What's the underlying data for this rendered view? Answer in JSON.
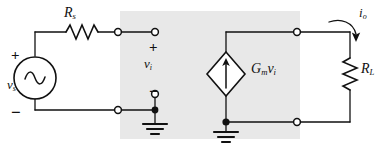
{
  "figure": {
    "kind": "circuit-schematic",
    "background_color": "#ffffff",
    "wire_color": "#111111",
    "shaded_region_color": "#e8e8e8"
  },
  "labels": {
    "source_resistor": "R",
    "source_resistor_sub": "s",
    "source_voltage": "v",
    "source_voltage_sub": "s",
    "input_voltage": "v",
    "input_voltage_sub": "i",
    "dependent_source_gm": "G",
    "dependent_source_gm_sub": "m",
    "dependent_source_v": "v",
    "dependent_source_v_sub": "i",
    "load_resistor": "R",
    "load_resistor_sub": "L",
    "output_current": "i",
    "output_current_sub": "o"
  },
  "polarity": {
    "source_plus": "+",
    "source_minus": "−",
    "input_plus": "+",
    "input_minus": "−"
  },
  "components": [
    {
      "name": "source-resistor-rs",
      "type": "resistor",
      "orientation": "horizontal",
      "label": "R_s"
    },
    {
      "name": "voltage-source-vs",
      "type": "ac-voltage-source",
      "orientation": "vertical",
      "label": "v_s"
    },
    {
      "name": "dependent-current-source",
      "type": "dependent-current-source",
      "orientation": "vertical",
      "label": "G_m v_i"
    },
    {
      "name": "load-resistor-rl",
      "type": "resistor",
      "orientation": "vertical",
      "label": "R_L"
    },
    {
      "name": "ground-input",
      "type": "ground",
      "orientation": "vertical"
    },
    {
      "name": "ground-output",
      "type": "ground",
      "orientation": "vertical"
    }
  ],
  "terminals": [
    {
      "name": "input-terminal-left-top",
      "x": 118,
      "y": 32
    },
    {
      "name": "input-terminal-right-top",
      "x": 155,
      "y": 32
    },
    {
      "name": "input-terminal-left-bottom",
      "x": 118,
      "y": 110
    },
    {
      "name": "input-terminal-right-bottom",
      "x": 155,
      "y": 94
    },
    {
      "name": "output-terminal-top",
      "x": 297,
      "y": 32
    },
    {
      "name": "output-terminal-bottom",
      "x": 297,
      "y": 122
    }
  ]
}
